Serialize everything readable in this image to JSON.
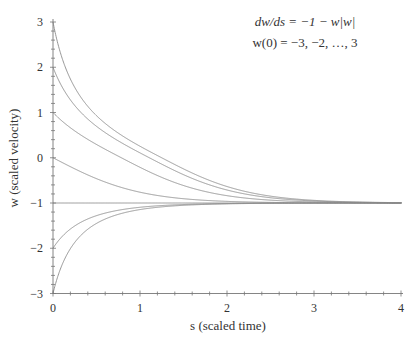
{
  "chart_data": {
    "type": "line",
    "title_lines": [
      "dw/ds = −1 − w|w|",
      "w(0) = −3, −2, …, 3"
    ],
    "xlabel": "s (scaled time)",
    "ylabel": "w (scaled velocity)",
    "xlim": [
      0,
      4
    ],
    "ylim": [
      -3,
      3
    ],
    "xticks": [
      "0",
      "1",
      "2",
      "3",
      "4"
    ],
    "yticks": [
      "3",
      "2",
      "1",
      "0",
      "−1",
      "−2",
      "−3"
    ],
    "grid": false,
    "legend": null,
    "initial_conditions": [
      -3,
      -2,
      -1,
      0,
      1,
      2,
      3
    ],
    "equilibrium": -1,
    "series": [
      {
        "name": "w(0)=3",
        "x": [
          0,
          0.5,
          1,
          2,
          3,
          4
        ],
        "y": [
          3,
          1.43,
          0.55,
          -0.67,
          -0.98,
          -1.0
        ]
      },
      {
        "name": "w(0)=2",
        "x": [
          0,
          0.5,
          1,
          2,
          3,
          4
        ],
        "y": [
          2,
          1.1,
          0.35,
          -0.73,
          -0.98,
          -1.0
        ]
      },
      {
        "name": "w(0)=1",
        "x": [
          0,
          0.5,
          1,
          2,
          3,
          4
        ],
        "y": [
          1,
          0.29,
          -0.19,
          -0.87,
          -0.99,
          -1.0
        ]
      },
      {
        "name": "w(0)=0",
        "x": [
          0,
          0.5,
          1,
          2,
          3,
          4
        ],
        "y": [
          0,
          -0.46,
          -0.76,
          -0.96,
          -1.0,
          -1.0
        ]
      },
      {
        "name": "w(0)=-1",
        "x": [
          0,
          4
        ],
        "y": [
          -1,
          -1
        ]
      },
      {
        "name": "w(0)=-2",
        "x": [
          0,
          0.5,
          1,
          2,
          3,
          4
        ],
        "y": [
          -2,
          -1.21,
          -1.07,
          -1.01,
          -1.0,
          -1.0
        ]
      },
      {
        "name": "w(0)=-3",
        "x": [
          0,
          0.5,
          1,
          2,
          3,
          4
        ],
        "y": [
          -3,
          -1.25,
          -1.08,
          -1.01,
          -1.0,
          -1.0
        ]
      }
    ]
  }
}
